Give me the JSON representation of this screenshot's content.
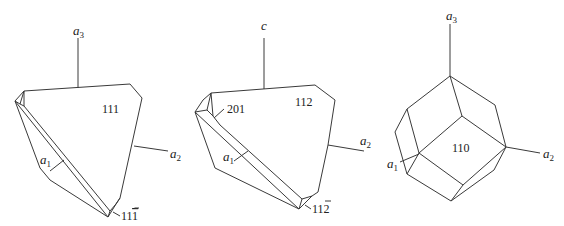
{
  "figures": [
    {
      "id": "fig-tetrahedron-111",
      "axis_labels": {
        "top": "a",
        "top_sub": "3",
        "right": "a",
        "right_sub": "2",
        "front": "a",
        "front_sub": "1"
      },
      "face_labels": {
        "main": "111",
        "small": "11",
        "small_bar": "1"
      }
    },
    {
      "id": "fig-tetragonal-112",
      "axis_labels": {
        "top": "c",
        "right": "a",
        "right_sub": "2",
        "front": "a",
        "front_sub": "1"
      },
      "face_labels": {
        "main": "112",
        "corner": "201",
        "small": "11",
        "small_bar": "2"
      }
    },
    {
      "id": "fig-dodecahedron-110",
      "axis_labels": {
        "top": "a",
        "top_sub": "3",
        "right": "a",
        "right_sub": "2",
        "front": "a",
        "front_sub": "1"
      },
      "face_labels": {
        "main": "110"
      }
    }
  ]
}
